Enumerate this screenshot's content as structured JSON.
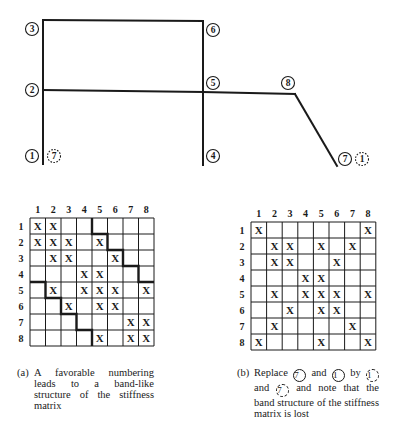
{
  "figure": {
    "frame": {
      "nodes": [
        {
          "id": "3",
          "label": "3",
          "x": 43,
          "y": 20,
          "label_x": 32,
          "label_y": 29,
          "style": "solid"
        },
        {
          "id": "6",
          "label": "6",
          "x": 203,
          "y": 21,
          "label_x": 213,
          "label_y": 30,
          "style": "solid"
        },
        {
          "id": "2",
          "label": "2",
          "x": 43,
          "y": 90,
          "label_x": 32,
          "label_y": 90,
          "style": "solid"
        },
        {
          "id": "5",
          "label": "5",
          "x": 203,
          "y": 92,
          "label_x": 213,
          "label_y": 83,
          "style": "solid"
        },
        {
          "id": "8",
          "label": "8",
          "x": 295,
          "y": 94,
          "label_x": 288,
          "label_y": 83,
          "style": "solid"
        },
        {
          "id": "1",
          "label": "1",
          "x": 43,
          "y": 164,
          "label_x": 32,
          "label_y": 156,
          "style": "solid"
        },
        {
          "id": "4",
          "label": "4",
          "x": 203,
          "y": 165,
          "label_x": 213,
          "label_y": 156,
          "style": "solid"
        },
        {
          "id": "7",
          "label": "7",
          "x": 337,
          "y": 166,
          "label_x": 345,
          "label_y": 159,
          "style": "solid"
        }
      ],
      "alt_labels": [
        {
          "label": "7",
          "x": 54,
          "y": 156,
          "style": "dashed"
        },
        {
          "label": "1",
          "x": 362,
          "y": 159,
          "style": "dashed"
        }
      ],
      "members": [
        [
          "1",
          "2"
        ],
        [
          "2",
          "3"
        ],
        [
          "3",
          "6"
        ],
        [
          "6",
          "5"
        ],
        [
          "5",
          "4"
        ],
        [
          "2",
          "5"
        ],
        [
          "5",
          "8"
        ],
        [
          "8",
          "7"
        ]
      ]
    },
    "matrices": [
      {
        "id": "a",
        "col_headers": [
          "1",
          "2",
          "3",
          "4",
          "5",
          "6",
          "7",
          "8"
        ],
        "row_headers": [
          "1",
          "2",
          "3",
          "4",
          "5",
          "6",
          "7",
          "8"
        ],
        "x_mark": "X",
        "rows": [
          [
            1,
            1,
            0,
            0,
            0,
            0,
            0,
            0
          ],
          [
            1,
            1,
            1,
            0,
            1,
            0,
            0,
            0
          ],
          [
            0,
            1,
            1,
            0,
            0,
            1,
            0,
            0
          ],
          [
            0,
            0,
            0,
            1,
            1,
            0,
            0,
            0
          ],
          [
            0,
            1,
            0,
            1,
            1,
            1,
            0,
            1
          ],
          [
            0,
            0,
            1,
            0,
            1,
            1,
            0,
            0
          ],
          [
            0,
            0,
            0,
            0,
            0,
            0,
            1,
            1
          ],
          [
            0,
            0,
            0,
            0,
            1,
            0,
            1,
            1
          ]
        ],
        "band_boundary": true
      },
      {
        "id": "b",
        "col_headers": [
          "1",
          "2",
          "3",
          "4",
          "5",
          "6",
          "7",
          "8"
        ],
        "row_headers": [
          "1",
          "2",
          "3",
          "4",
          "5",
          "6",
          "7",
          "8"
        ],
        "x_mark": "X",
        "rows": [
          [
            1,
            0,
            0,
            0,
            0,
            0,
            0,
            1
          ],
          [
            0,
            1,
            1,
            0,
            1,
            0,
            1,
            0
          ],
          [
            0,
            1,
            1,
            0,
            0,
            1,
            0,
            0
          ],
          [
            0,
            0,
            0,
            1,
            1,
            0,
            0,
            0
          ],
          [
            0,
            1,
            0,
            1,
            1,
            1,
            0,
            1
          ],
          [
            0,
            0,
            1,
            0,
            1,
            1,
            0,
            0
          ],
          [
            0,
            1,
            0,
            0,
            0,
            0,
            1,
            0
          ],
          [
            1,
            0,
            0,
            0,
            1,
            0,
            0,
            1
          ]
        ],
        "band_boundary": false
      }
    ],
    "captions": {
      "a": {
        "tag": "(a)",
        "text": "A favorable numbering leads to a band-like structure of the stiffness matrix"
      },
      "b": {
        "tag": "(b)",
        "part1": "Replace",
        "circle_7": "7",
        "part2": "and",
        "circle_1": "1",
        "part3": "by",
        "dashed_1": "1",
        "part4": "and",
        "dashed_7": "7",
        "part5": "and note that the band structure of the stiffness matrix is lost"
      }
    },
    "colors": {
      "ink": "#1a1a1a",
      "background": "#ffffff"
    }
  }
}
